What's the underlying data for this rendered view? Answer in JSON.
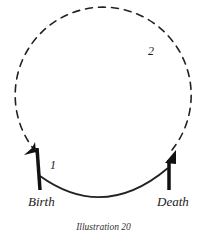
{
  "diagram": {
    "type": "life-cycle circle",
    "labels": {
      "start": "Birth",
      "end": "Death",
      "segment_lower": "1",
      "segment_upper": "2"
    },
    "caption": "Illustration 20",
    "colors": {
      "ink": "#1a1a1a",
      "background": "#ffffff"
    }
  }
}
